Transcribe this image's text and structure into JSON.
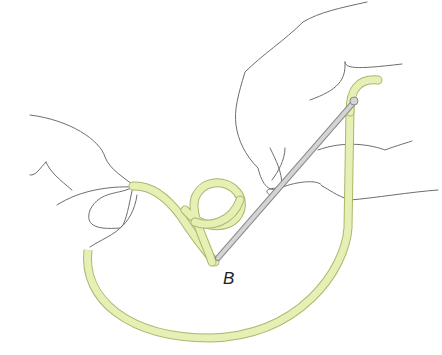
{
  "figure": {
    "label": "B",
    "colors": {
      "tube_fill": "#e6efb4",
      "tube_edge": "#a9b86a",
      "wire_fill": "#d4d4d4",
      "wire_edge": "#8a8a8a",
      "outline": "#6e6e6e",
      "background": "#ffffff"
    }
  }
}
